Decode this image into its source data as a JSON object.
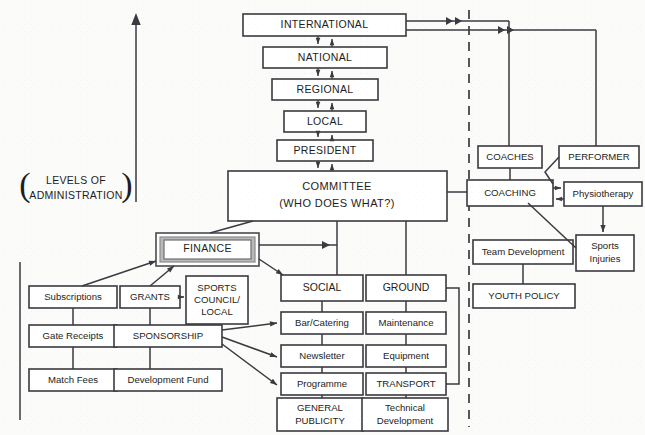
{
  "diagram": {
    "title_left": {
      "line1": "LEVELS OF",
      "line2": "ADMINISTRATION"
    },
    "levels": [
      {
        "id": "international",
        "label": "INTERNATIONAL"
      },
      {
        "id": "national",
        "label": "NATIONAL"
      },
      {
        "id": "regional",
        "label": "REGIONAL"
      },
      {
        "id": "local",
        "label": "LOCAL"
      },
      {
        "id": "president",
        "label": "PRESIDENT"
      }
    ],
    "committee": {
      "line1": "COMMITTEE",
      "line2": "(WHO DOES WHAT?)"
    },
    "finance": {
      "label": "FINANCE"
    },
    "income": [
      {
        "id": "subscriptions",
        "label": "Subscriptions"
      },
      {
        "id": "gate-receipts",
        "label": "Gate Receipts"
      },
      {
        "id": "match-fees",
        "label": "Match Fees"
      }
    ],
    "funding": [
      {
        "id": "grants",
        "label": "GRANTS"
      },
      {
        "id": "sponsorship",
        "label": "SPONSORSHIP"
      },
      {
        "id": "development-fund",
        "label": "Development Fund"
      }
    ],
    "sports_council": {
      "line1": "SPORTS",
      "line2": "COUNCIL/",
      "line3": "LOCAL"
    },
    "social": {
      "label": "SOCIAL",
      "items": [
        {
          "id": "bar-catering",
          "label": "Bar/Catering"
        },
        {
          "id": "newsletter",
          "label": "Newsletter"
        },
        {
          "id": "programme",
          "label": "Programme"
        }
      ],
      "publicity": {
        "line1": "GENERAL",
        "line2": "PUBLICITY"
      }
    },
    "ground": {
      "label": "GROUND",
      "items": [
        {
          "id": "maintenance",
          "label": "Maintenance"
        },
        {
          "id": "equipment",
          "label": "Equipment"
        },
        {
          "id": "transport",
          "label": "TRANSPORT"
        }
      ],
      "technical": {
        "line1": "Technical",
        "line2": "Development"
      }
    },
    "coaching_cluster": {
      "coaches": "COACHES",
      "performer": "PERFORMER",
      "coaching": "COACHING",
      "physiotherapy": "Physiotherapy",
      "sports_injuries": {
        "line1": "Sports",
        "line2": "Injuries"
      },
      "team_development": "Team Development",
      "youth_policy": "YOUTH POLICY"
    },
    "colors": {
      "ink": "#1d1d22",
      "stroke": "#3a3a40",
      "finance_frame": "#b9b9b9",
      "background": "#fbfbfa"
    }
  }
}
